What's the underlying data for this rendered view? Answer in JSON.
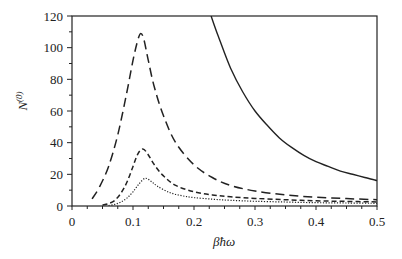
{
  "chart_data": {
    "type": "line",
    "title": "",
    "xlabel": "βħω",
    "ylabel": "N(0)",
    "ylabel_main": "N",
    "ylabel_sup": "(0)",
    "xlim": [
      0,
      0.5
    ],
    "ylim": [
      0,
      120
    ],
    "x_ticks": [
      0,
      0.1,
      0.2,
      0.3,
      0.4,
      0.5
    ],
    "x_tick_labels": [
      "0",
      "0.1",
      "0.2",
      "0.3",
      "0.4",
      "0.5"
    ],
    "y_ticks": [
      0,
      20,
      40,
      60,
      80,
      100,
      120
    ],
    "y_tick_labels": [
      "0",
      "20",
      "40",
      "60",
      "80",
      "100",
      "120"
    ],
    "x_minor_step": 0.025,
    "y_minor_step": 10,
    "grid": false,
    "legend": null,
    "series": [
      {
        "name": "solid",
        "style": "solid",
        "x": [
          0.228,
          0.24,
          0.26,
          0.28,
          0.3,
          0.32,
          0.34,
          0.36,
          0.38,
          0.4,
          0.42,
          0.44,
          0.46,
          0.48,
          0.5
        ],
        "y": [
          120,
          107,
          87,
          72,
          60,
          51,
          43,
          37,
          32,
          28,
          25,
          22,
          20,
          18,
          16
        ]
      },
      {
        "name": "long-dashed",
        "style": "long-dash",
        "x": [
          0.033,
          0.045,
          0.06,
          0.075,
          0.09,
          0.1,
          0.108,
          0.113,
          0.118,
          0.125,
          0.135,
          0.15,
          0.17,
          0.2,
          0.23,
          0.26,
          0.3,
          0.35,
          0.4,
          0.45,
          0.5
        ],
        "y": [
          4.5,
          12,
          25,
          45,
          72,
          92,
          105,
          109,
          105,
          92,
          75,
          57,
          40,
          26,
          18,
          13,
          9.5,
          7,
          5.5,
          4.7,
          4
        ]
      },
      {
        "name": "medium-dashed",
        "style": "medium-dash",
        "x": [
          0.05,
          0.06,
          0.07,
          0.08,
          0.09,
          0.1,
          0.108,
          0.116,
          0.124,
          0.135,
          0.15,
          0.17,
          0.2,
          0.23,
          0.26,
          0.3,
          0.35,
          0.4,
          0.45,
          0.5
        ],
        "y": [
          0.5,
          1.5,
          3.5,
          8,
          15,
          25,
          33,
          36,
          33,
          26,
          19,
          13,
          9,
          7,
          5.8,
          4.8,
          4,
          3.3,
          2.9,
          2.6
        ]
      },
      {
        "name": "dotted",
        "style": "dotted",
        "x": [
          0.06,
          0.07,
          0.08,
          0.09,
          0.1,
          0.11,
          0.12,
          0.13,
          0.14,
          0.16,
          0.18,
          0.2,
          0.23,
          0.26,
          0.3,
          0.35,
          0.4,
          0.45,
          0.5
        ],
        "y": [
          0.3,
          1,
          2.5,
          5,
          9,
          14,
          17.5,
          15.5,
          12.5,
          8.5,
          6.5,
          5.3,
          4.3,
          3.6,
          3,
          2.5,
          2.1,
          1.9,
          1.7
        ]
      }
    ]
  },
  "plot_area": {
    "left": 72,
    "top": 16,
    "right": 377,
    "bottom": 206
  }
}
